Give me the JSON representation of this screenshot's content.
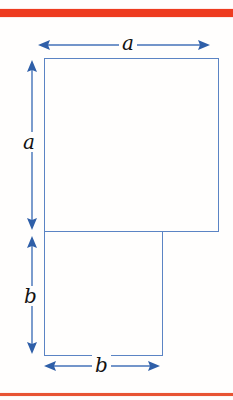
{
  "figure": {
    "background_color": "#fffefd",
    "rules": {
      "top": {
        "color": "#ee3b1f",
        "thickness_px": 8
      },
      "bottom": {
        "color": "#e85434",
        "thickness_px": 3
      }
    },
    "shapes": [
      {
        "name": "square-a",
        "outline_color": "#5b84c4",
        "fill": "none",
        "x": 44,
        "y": 58,
        "width": 175,
        "height": 174
      },
      {
        "name": "rect-b",
        "outline_color": "#5b84c4",
        "fill": "none",
        "x": 44,
        "y": 231,
        "width": 119,
        "height": 125
      }
    ],
    "dimensions": [
      {
        "name": "dim-a-top",
        "label": "a",
        "orientation": "horizontal",
        "arrow_color": "#4472b8",
        "from": 38,
        "to": 208,
        "axis_pos": 45
      },
      {
        "name": "dim-a-left",
        "label": "a",
        "orientation": "vertical",
        "arrow_color": "#4472b8",
        "from": 60,
        "to": 228,
        "axis_pos": 31
      },
      {
        "name": "dim-b-left",
        "label": "b",
        "orientation": "vertical",
        "arrow_color": "#4472b8",
        "from": 236,
        "to": 352,
        "axis_pos": 31
      },
      {
        "name": "dim-b-bottom",
        "label": "b",
        "orientation": "horizontal",
        "arrow_color": "#4472b8",
        "from": 44,
        "to": 158,
        "axis_pos": 366
      }
    ]
  }
}
